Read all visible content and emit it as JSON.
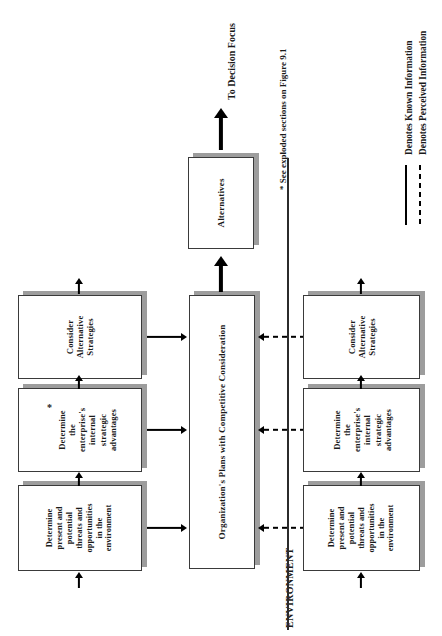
{
  "figure": {
    "title_note": "* See exploded sections on Figure 9.1",
    "decision_label": "To Decision Focus",
    "environment_label": "ENVIRONMENT",
    "star_marker": "*"
  },
  "center": {
    "plans_box": "Organization's Plans with Competitive Consideration",
    "alternatives_box": "Alternatives"
  },
  "known_row": {
    "name": "Known Information Row",
    "boxes": [
      {
        "id": "known-threats",
        "lines": [
          "Determine",
          "present and",
          "potential",
          "threats and",
          "opportunities",
          "in the",
          "environment"
        ]
      },
      {
        "id": "known-internal",
        "lines": [
          "Determine",
          "the",
          "enterprise's",
          "internal",
          "strategic",
          "advantages"
        ]
      },
      {
        "id": "known-strategies",
        "lines": [
          "Consider",
          "Alternative",
          "Strategies"
        ]
      }
    ]
  },
  "perceived_row": {
    "name": "Perceived Information Row",
    "boxes": [
      {
        "id": "perceived-threats",
        "lines": [
          "Determine",
          "present and",
          "potential",
          "threats and",
          "opportunities",
          "in the",
          "environment"
        ]
      },
      {
        "id": "perceived-internal",
        "lines": [
          "Determine",
          "the",
          "enterprise's",
          "internal",
          "strategic",
          "advantages"
        ]
      },
      {
        "id": "perceived-strategies",
        "lines": [
          "Consider",
          "Alternative",
          "Strategies"
        ]
      }
    ]
  },
  "legend": {
    "items": [
      {
        "style": "solid",
        "label": "Denotes Known Information"
      },
      {
        "style": "dashed",
        "label": "Denotes Perceived Information"
      }
    ]
  },
  "colors": {
    "line": "#000000",
    "box_border": "#3a3a3a",
    "box_shadow": "#9d9d9d",
    "background": "#ffffff"
  }
}
